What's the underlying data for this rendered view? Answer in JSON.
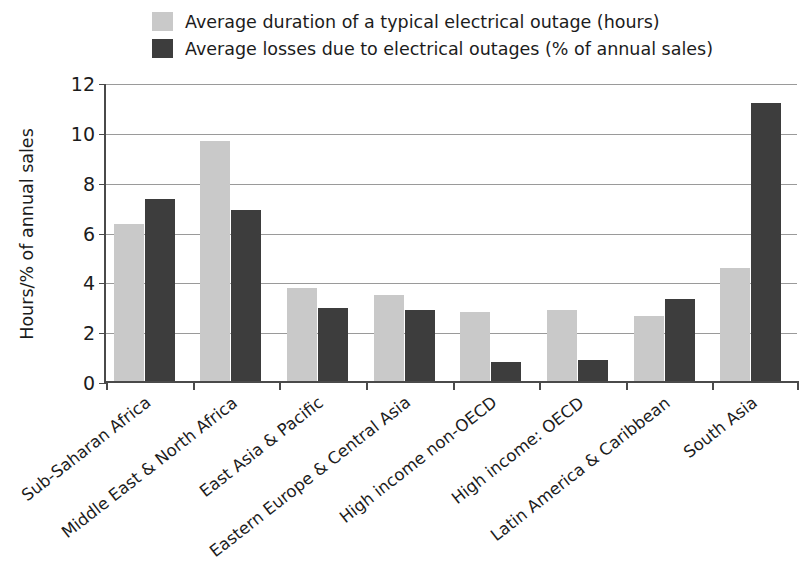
{
  "chart_data": {
    "type": "bar",
    "title": "",
    "xlabel": "",
    "ylabel": "Hours/% of annual sales",
    "ylim": [
      0,
      12
    ],
    "yticks": [
      0,
      2,
      4,
      6,
      8,
      10,
      12
    ],
    "ytick_labels": [
      "0",
      "2",
      "4",
      "6",
      "8",
      "10",
      "12"
    ],
    "grid": true,
    "legend_position": "top-left",
    "categories": [
      "Sub-Saharan Africa",
      "Middle East & North Africa",
      "East Asia & Pacific",
      "Eastern Europe & Central Asia",
      "High income non-OECD",
      "High income: OECD",
      "Latin America & Caribbean",
      "South Asia"
    ],
    "series": [
      {
        "name": "Average duration of a typical electrical outage (hours)",
        "color": "#c9c9c9",
        "values": [
          6.3,
          9.65,
          3.75,
          3.45,
          2.75,
          2.85,
          2.6,
          4.55
        ]
      },
      {
        "name": "Average losses due to electrical outages (% of annual sales)",
        "color": "#3d3d3d",
        "values": [
          7.3,
          6.85,
          2.95,
          2.85,
          0.75,
          0.85,
          3.3,
          11.15
        ]
      }
    ]
  },
  "legend": {
    "items": [
      {
        "label": "Average duration of a typical electrical outage (hours)",
        "color": "#c9c9c9"
      },
      {
        "label": "Average losses due to electrical outages (% of annual sales)",
        "color": "#3d3d3d"
      }
    ]
  },
  "axis": {
    "y_title": "Hours/% of annual sales"
  }
}
